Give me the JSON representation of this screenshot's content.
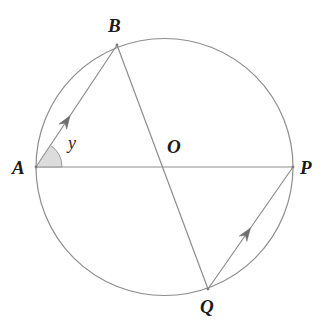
{
  "figure": {
    "kind": "circle-geometry-diagram",
    "width": 332,
    "height": 326,
    "background_color": "#ffffff"
  },
  "colors": {
    "stroke": "#8d8d8d",
    "circle_stroke": "#8d8d8d",
    "chord_stroke": "#8d8d8d",
    "arrow_fill": "#6e6e6e",
    "angle_fill": "#d6d6d6",
    "angle_stroke": "#9a9a9a",
    "label_color": "#1b1b1b",
    "angle_label_color": "#2a2a2a"
  },
  "circle": {
    "center_x": 164.5,
    "center_y": 167,
    "radius": 128.5,
    "stroke_width": 1.2
  },
  "points": {
    "A": {
      "label": "A",
      "x": 36,
      "y": 167
    },
    "B": {
      "label": "B",
      "x": 117,
      "y": 45
    },
    "O": {
      "label": "O",
      "x": 164.5,
      "y": 167
    },
    "P": {
      "label": "P",
      "x": 293,
      "y": 167
    },
    "Q": {
      "label": "Q",
      "x": 208,
      "y": 289
    }
  },
  "segments": [
    {
      "name": "AP",
      "from": "A",
      "to": "P",
      "kind": "diameter",
      "arrow": false
    },
    {
      "name": "BQ",
      "from": "B",
      "to": "Q",
      "kind": "diameter",
      "arrow": false
    },
    {
      "name": "AB",
      "from": "A",
      "to": "B",
      "kind": "chord",
      "arrow": true,
      "arrow_position": 0.42
    },
    {
      "name": "QP",
      "from": "Q",
      "to": "P",
      "kind": "chord",
      "arrow": true,
      "arrow_position": 0.5
    }
  ],
  "angle_mark": {
    "label": "y",
    "vertex": "A",
    "between": [
      "AB",
      "AP"
    ],
    "radius": 26,
    "filled": true
  },
  "labels": {
    "A": "A",
    "B": "B",
    "O": "O",
    "P": "P",
    "Q": "Q",
    "y": "y"
  }
}
